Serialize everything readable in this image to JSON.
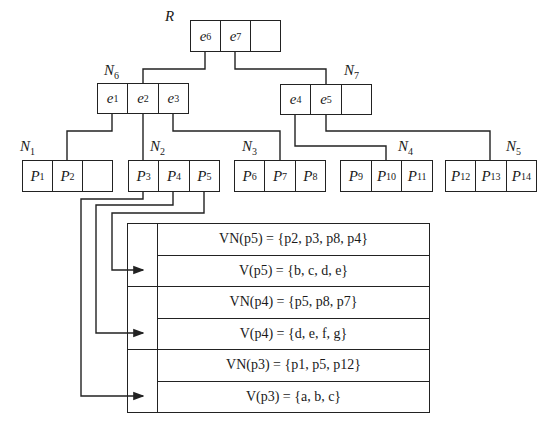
{
  "tree": {
    "root": {
      "label": "R",
      "entries": [
        "e6",
        "e7",
        ""
      ]
    },
    "internal": [
      {
        "label": "N6",
        "entries": [
          "e1",
          "e2",
          "e3"
        ]
      },
      {
        "label": "N7",
        "entries": [
          "e4",
          "e5",
          ""
        ]
      }
    ],
    "leaves": [
      {
        "label": "N1",
        "entries": [
          "P1",
          "P2",
          ""
        ]
      },
      {
        "label": "N2",
        "entries": [
          "P3",
          "P4",
          "P5"
        ]
      },
      {
        "label": "N3",
        "entries": [
          "P6",
          "P7",
          "P8"
        ]
      },
      {
        "label": "N4",
        "entries": [
          "P9",
          "P10",
          "P11"
        ]
      },
      {
        "label": "N5",
        "entries": [
          "P12",
          "P13",
          "P14"
        ]
      }
    ]
  },
  "table": {
    "rows": [
      "VN(p5) = {p2, p3, p8, p4}",
      "V(p5) = {b, c, d, e}",
      "VN(p4) = {p5, p8, p7}",
      "V(p4) = {d, e, f, g}",
      "VN(p3) = {p1, p5, p12}",
      "V(p3) = {a, b, c}"
    ]
  },
  "pointers": [
    {
      "from": "P5",
      "to_row": 0
    },
    {
      "from": "P4",
      "to_row": 2
    },
    {
      "from": "P3",
      "to_row": 4
    }
  ]
}
